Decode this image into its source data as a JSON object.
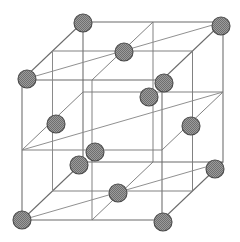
{
  "figure": {
    "caption": "",
    "background_color": "#ffffff",
    "edge_color": "#6b6b6b",
    "grid_color": "#7a7a7a",
    "atom_fill_color": "#8c8c8c",
    "atom_stroke_color": "#4a4a4a",
    "atom_radius": 9,
    "projection": "oblique parallel projection",
    "lattice_type": "face-centered cubic (FCC)",
    "subdivisions_per_edge": 2
  },
  "geometry": {
    "width": 240,
    "height": 242,
    "origin_front_bottom_left": [
      22,
      220
    ],
    "vector_x": [
      140,
      0
    ],
    "vector_y": [
      0,
      -140
    ],
    "vector_z": [
      61,
      -58
    ],
    "corners": {
      "front_bottom_left": [
        22,
        220
      ],
      "front_bottom_right": [
        162,
        220
      ],
      "front_top_left": [
        22,
        80
      ],
      "front_top_right": [
        162,
        80
      ],
      "back_bottom_left": [
        83,
        162
      ],
      "back_bottom_right": [
        223,
        162
      ],
      "back_top_left": [
        83,
        22
      ],
      "back_top_right": [
        223,
        22
      ]
    }
  },
  "atoms": [
    {
      "id": "corner-back-top-left",
      "label": "corner atom",
      "site": "corner",
      "cx": 83,
      "cy": 23,
      "r": 9
    },
    {
      "id": "corner-back-top-right",
      "label": "corner atom",
      "site": "corner",
      "cx": 221,
      "cy": 26,
      "r": 9
    },
    {
      "id": "face-top-center",
      "label": "face-center atom",
      "site": "face",
      "cx": 124,
      "cy": 52,
      "r": 9
    },
    {
      "id": "corner-front-top-left",
      "label": "corner atom",
      "site": "corner",
      "cx": 27,
      "cy": 79,
      "r": 9
    },
    {
      "id": "face-right-upper",
      "label": "face-center atom",
      "site": "face",
      "cx": 164,
      "cy": 83,
      "r": 9
    },
    {
      "id": "face-back-center",
      "label": "face-center atom",
      "site": "face",
      "cx": 149,
      "cy": 97,
      "r": 9
    },
    {
      "id": "face-left-center",
      "label": "face-center atom",
      "site": "face",
      "cx": 56,
      "cy": 124,
      "r": 9
    },
    {
      "id": "face-right-center",
      "label": "face-center atom",
      "site": "face",
      "cx": 191,
      "cy": 126,
      "r": 9
    },
    {
      "id": "face-front-center",
      "label": "face-center atom",
      "site": "face",
      "cx": 95,
      "cy": 152,
      "r": 9
    },
    {
      "id": "face-bottom-center",
      "label": "face-center atom",
      "site": "face",
      "cx": 79,
      "cy": 165,
      "r": 9
    },
    {
      "id": "corner-back-bottom-right",
      "label": "corner atom",
      "site": "corner",
      "cx": 215,
      "cy": 169,
      "r": 9
    },
    {
      "id": "corner-back-bottom-left",
      "label": "corner atom",
      "site": "corner",
      "cx": 118,
      "cy": 193,
      "r": 9
    },
    {
      "id": "corner-front-bottom-left",
      "label": "corner atom",
      "site": "corner",
      "cx": 22,
      "cy": 220,
      "r": 9
    },
    {
      "id": "corner-front-bottom-right",
      "label": "corner atom",
      "site": "corner",
      "cx": 163,
      "cy": 222,
      "r": 9
    }
  ],
  "counts": {
    "total_atoms_drawn": 14,
    "corner_atoms": 8,
    "face_atoms": 6
  }
}
